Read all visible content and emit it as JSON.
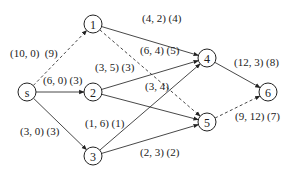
{
  "diagram": {
    "type": "flow-network",
    "nodes": [
      {
        "id": "s",
        "label": "s"
      },
      {
        "id": "1",
        "label": "1"
      },
      {
        "id": "2",
        "label": "2"
      },
      {
        "id": "3",
        "label": "3"
      },
      {
        "id": "4",
        "label": "4"
      },
      {
        "id": "5",
        "label": "5"
      },
      {
        "id": "6",
        "label": "6"
      }
    ],
    "edges": [
      {
        "from": "s",
        "to": "1",
        "label": "(10, 0)  (9)",
        "style": "dashed"
      },
      {
        "from": "s",
        "to": "2",
        "label": "(6, 0) (3)",
        "style": "solid"
      },
      {
        "from": "s",
        "to": "3",
        "label": "(3, 0) (3)",
        "style": "solid"
      },
      {
        "from": "1",
        "to": "4",
        "label": "(4, 2) (4)",
        "style": "solid"
      },
      {
        "from": "1",
        "to": "5",
        "label": "(6, 4) (5)",
        "style": "dashed"
      },
      {
        "from": "2",
        "to": "4",
        "label": "(3, 5) (3)",
        "style": "solid"
      },
      {
        "from": "2",
        "to": "5",
        "label": "(3, 4)",
        "style": "solid"
      },
      {
        "from": "3",
        "to": "4",
        "label": "(1, 6) (1)",
        "style": "solid"
      },
      {
        "from": "3",
        "to": "5",
        "label": "(2, 3) (2)",
        "style": "solid"
      },
      {
        "from": "4",
        "to": "6",
        "label": "(12, 3) (8)",
        "style": "solid"
      },
      {
        "from": "5",
        "to": "6",
        "label": "(9, 12) (7)",
        "style": "dashed"
      }
    ]
  }
}
